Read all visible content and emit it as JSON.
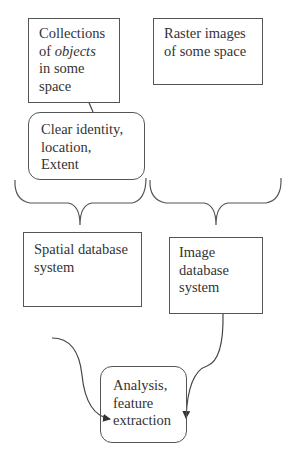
{
  "diagram": {
    "nodes": {
      "collections": {
        "lines": [
          "Collections",
          "of ",
          "objects",
          "in some",
          "space"
        ],
        "shape": "rectangle"
      },
      "raster": {
        "lines": [
          "Raster images",
          "of some space"
        ],
        "shape": "rectangle"
      },
      "identity": {
        "lines": [
          "Clear identity,",
          "location,",
          "Extent"
        ],
        "shape": "rounded-rectangle"
      },
      "spatial_db": {
        "lines": [
          "Spatial database",
          "system"
        ],
        "shape": "rectangle"
      },
      "image_db": {
        "lines": [
          "Image",
          "database",
          "system"
        ],
        "shape": "rectangle"
      },
      "analysis": {
        "lines": [
          "Analysis,",
          "feature",
          "extraction"
        ],
        "shape": "rounded-rectangle"
      }
    },
    "edges": [
      {
        "from": "identity",
        "to": "collections",
        "type": "arrow"
      },
      {
        "from": "collections",
        "to": "spatial_db",
        "type": "brace"
      },
      {
        "from": "raster",
        "to": "image_db",
        "type": "brace"
      },
      {
        "from": "spatial_db",
        "to": "analysis",
        "type": "curved-arrow"
      },
      {
        "from": "image_db",
        "to": "analysis",
        "type": "curved-arrow"
      }
    ],
    "colors": {
      "stroke": "#555555",
      "text": "#333333",
      "background": "#ffffff"
    }
  }
}
